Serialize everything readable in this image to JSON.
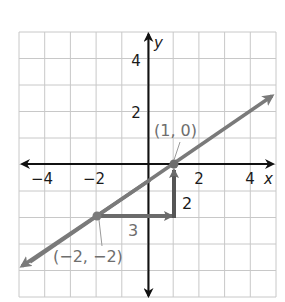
{
  "graph": {
    "x_range": [
      -5,
      5
    ],
    "y_range": [
      -5,
      5
    ],
    "x_axis_label": "x",
    "y_axis_label": "y",
    "x_ticks": [
      {
        "value": -4,
        "label": "−4"
      },
      {
        "value": -2,
        "label": "−2"
      },
      {
        "value": 2,
        "label": "2"
      },
      {
        "value": 4,
        "label": "4"
      }
    ],
    "y_ticks": [
      {
        "value": 4,
        "label": "4"
      },
      {
        "value": 2,
        "label": "2"
      }
    ],
    "line": {
      "slope": "2/3",
      "through": [
        [
          -2,
          -2
        ],
        [
          1,
          0
        ]
      ],
      "color": "#7a7a7a"
    },
    "points": [
      {
        "x": 1,
        "y": 0,
        "label": "(1, 0)"
      },
      {
        "x": -2,
        "y": -2,
        "label": "(−2, −2)"
      }
    ],
    "run": {
      "label": "3",
      "from": [
        -2,
        -2
      ],
      "to": [
        1,
        -2
      ]
    },
    "rise": {
      "label": "2",
      "from": [
        1,
        -2
      ],
      "to": [
        1,
        0
      ]
    },
    "colors": {
      "grid": "#c8c8c8",
      "axis": "#111111",
      "line": "#7a7a7a",
      "rise_run": "#6b6b6b"
    }
  }
}
